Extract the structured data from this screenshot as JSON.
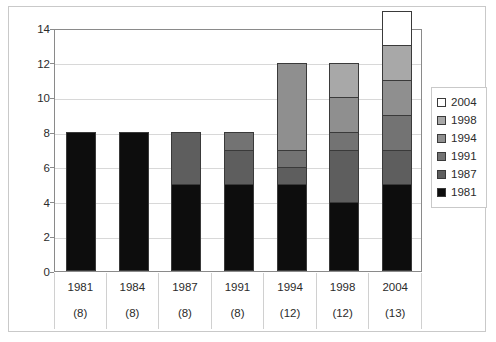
{
  "chart_data": {
    "type": "bar",
    "stacked": true,
    "title": "",
    "subtitle": "",
    "xlabel": "",
    "ylabel": "",
    "ylim": [
      0,
      14
    ],
    "ytick_step": 2,
    "yticks": [
      "0",
      "2",
      "4",
      "6",
      "8",
      "10",
      "12",
      "14"
    ],
    "grid": true,
    "grid_axis": "y",
    "legend_position": "right",
    "categories": [
      "1981",
      "1984",
      "1987",
      "1991",
      "1994",
      "1998",
      "2004"
    ],
    "category_counts": [
      "(8)",
      "(8)",
      "(8)",
      "(8)",
      "(12)",
      "(12)",
      "(13)"
    ],
    "totals": [
      8,
      8,
      8,
      8,
      12,
      12,
      13
    ],
    "series": [
      {
        "name": "1981",
        "color": "#0d0d0d",
        "values": [
          8,
          8,
          5,
          5,
          5,
          4,
          5
        ]
      },
      {
        "name": "1987",
        "color": "#5e5e5e",
        "values": [
          0,
          0,
          3,
          2,
          1,
          3,
          2
        ]
      },
      {
        "name": "1991",
        "color": "#737373",
        "values": [
          0,
          0,
          0,
          1,
          1,
          1,
          2
        ]
      },
      {
        "name": "1994",
        "color": "#8f8f8f",
        "values": [
          0,
          0,
          0,
          0,
          5,
          2,
          2
        ]
      },
      {
        "name": "1998",
        "color": "#a8a8a8",
        "values": [
          0,
          0,
          0,
          0,
          0,
          2,
          2
        ]
      },
      {
        "name": "2004",
        "color": "#ffffff",
        "values": [
          0,
          0,
          0,
          0,
          0,
          0,
          2
        ]
      }
    ],
    "legend_entries": [
      {
        "label": "2004",
        "color": "#ffffff"
      },
      {
        "label": "1998",
        "color": "#a8a8a8"
      },
      {
        "label": "1994",
        "color": "#8f8f8f"
      },
      {
        "label": "1991",
        "color": "#737373"
      },
      {
        "label": "1987",
        "color": "#5e5e5e"
      },
      {
        "label": "1981",
        "color": "#0d0d0d"
      }
    ]
  },
  "colors": {
    "plot_border": "#8a8a8a",
    "gridline": "#d8d8d8",
    "frame_border": "#c9c9c9",
    "bar_outline": "#3a3a3a",
    "text": "#2b2b2b",
    "background": "#ffffff"
  }
}
